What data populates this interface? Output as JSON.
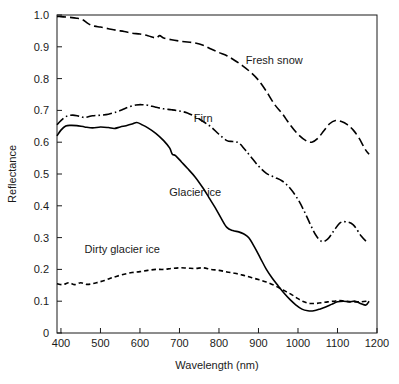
{
  "chart_data": {
    "type": "line",
    "title": "",
    "xlabel": "Wavelength (nm)",
    "ylabel": "Reflectance",
    "xlim": [
      390,
      1200
    ],
    "ylim": [
      0,
      1.0
    ],
    "grid": false,
    "legend_position": "inline-annotations",
    "xticks": [
      400,
      500,
      600,
      700,
      800,
      900,
      1000,
      1100,
      1200
    ],
    "xtick_labels": [
      "400",
      "500",
      "600",
      "700",
      "800",
      "900",
      "1000",
      "1100",
      "1200"
    ],
    "yticks": [
      0,
      0.1,
      0.2,
      0.3,
      0.4,
      0.5,
      0.6,
      0.7,
      0.8,
      0.9,
      1.0
    ],
    "ytick_labels": [
      "0",
      "0.1",
      "0.2",
      "0.3",
      "0.4",
      "0.5",
      "0.6",
      "0.7",
      "0.8",
      "0.9",
      "1.0"
    ],
    "series": [
      {
        "name": "Fresh snow",
        "line_style": "dashed",
        "color": "#000000",
        "label_x": 940,
        "label_y": 0.845,
        "x": [
          390,
          400,
          420,
          440,
          455,
          470,
          485,
          500,
          520,
          540,
          560,
          580,
          600,
          620,
          640,
          650,
          660,
          680,
          700,
          720,
          740,
          760,
          780,
          800,
          820,
          840,
          860,
          880,
          900,
          920,
          940,
          960,
          980,
          1000,
          1020,
          1035,
          1050,
          1065,
          1080,
          1095,
          1110,
          1125,
          1140,
          1155,
          1170,
          1180
        ],
        "y": [
          0.995,
          0.995,
          0.993,
          0.99,
          0.985,
          0.972,
          0.965,
          0.962,
          0.957,
          0.952,
          0.948,
          0.943,
          0.94,
          0.935,
          0.928,
          0.935,
          0.928,
          0.922,
          0.918,
          0.915,
          0.912,
          0.905,
          0.893,
          0.882,
          0.872,
          0.857,
          0.84,
          0.82,
          0.795,
          0.76,
          0.72,
          0.69,
          0.655,
          0.625,
          0.605,
          0.6,
          0.612,
          0.635,
          0.658,
          0.668,
          0.665,
          0.655,
          0.638,
          0.612,
          0.578,
          0.562
        ]
      },
      {
        "name": "Firn",
        "line_style": "dashdot",
        "color": "#000000",
        "label_x": 760,
        "label_y": 0.665,
        "x": [
          390,
          400,
          415,
          430,
          445,
          460,
          480,
          500,
          520,
          540,
          555,
          570,
          590,
          605,
          620,
          640,
          660,
          680,
          700,
          720,
          740,
          760,
          780,
          800,
          820,
          835,
          850,
          865,
          880,
          900,
          920,
          940,
          960,
          980,
          1000,
          1015,
          1030,
          1045,
          1060,
          1075,
          1090,
          1105,
          1120,
          1140,
          1160,
          1175
        ],
        "y": [
          0.655,
          0.668,
          0.682,
          0.685,
          0.682,
          0.678,
          0.683,
          0.685,
          0.688,
          0.695,
          0.702,
          0.71,
          0.717,
          0.718,
          0.716,
          0.71,
          0.705,
          0.702,
          0.698,
          0.692,
          0.68,
          0.665,
          0.648,
          0.625,
          0.605,
          0.602,
          0.598,
          0.578,
          0.555,
          0.525,
          0.502,
          0.49,
          0.478,
          0.455,
          0.42,
          0.385,
          0.345,
          0.308,
          0.288,
          0.295,
          0.32,
          0.345,
          0.35,
          0.34,
          0.305,
          0.285
        ]
      },
      {
        "name": "Glacier ice",
        "line_style": "solid",
        "color": "#000000",
        "label_x": 740,
        "label_y": 0.43,
        "x": [
          390,
          400,
          412,
          425,
          440,
          460,
          480,
          500,
          520,
          535,
          550,
          565,
          580,
          592,
          605,
          620,
          640,
          660,
          675,
          682,
          690,
          705,
          720,
          740,
          760,
          775,
          790,
          805,
          820,
          835,
          850,
          862,
          875,
          890,
          905,
          920,
          935,
          950,
          965,
          980,
          995,
          1010,
          1025,
          1040,
          1055,
          1070,
          1085,
          1100,
          1115,
          1130,
          1145,
          1160,
          1172,
          1180
        ],
        "y": [
          0.62,
          0.638,
          0.651,
          0.653,
          0.652,
          0.648,
          0.645,
          0.648,
          0.646,
          0.643,
          0.648,
          0.652,
          0.657,
          0.662,
          0.655,
          0.645,
          0.628,
          0.605,
          0.582,
          0.562,
          0.558,
          0.538,
          0.518,
          0.49,
          0.455,
          0.425,
          0.395,
          0.362,
          0.332,
          0.322,
          0.318,
          0.312,
          0.3,
          0.27,
          0.235,
          0.2,
          0.172,
          0.148,
          0.125,
          0.105,
          0.088,
          0.075,
          0.07,
          0.07,
          0.075,
          0.082,
          0.09,
          0.098,
          0.1,
          0.098,
          0.1,
          0.092,
          0.088,
          0.1
        ]
      },
      {
        "name": "Dirty glacier ice",
        "line_style": "shortdash",
        "color": "#000000",
        "label_x": 555,
        "label_y": 0.253,
        "x": [
          390,
          405,
          420,
          435,
          450,
          465,
          480,
          495,
          510,
          525,
          540,
          560,
          580,
          600,
          620,
          640,
          660,
          680,
          700,
          720,
          740,
          760,
          780,
          800,
          820,
          840,
          860,
          880,
          900,
          920,
          940,
          955,
          970,
          985,
          1000,
          1015,
          1030,
          1045,
          1060,
          1075,
          1090,
          1105,
          1120,
          1140,
          1160,
          1175
        ],
        "y": [
          0.155,
          0.152,
          0.158,
          0.152,
          0.158,
          0.153,
          0.155,
          0.16,
          0.165,
          0.172,
          0.178,
          0.185,
          0.19,
          0.193,
          0.197,
          0.2,
          0.2,
          0.203,
          0.205,
          0.204,
          0.203,
          0.205,
          0.2,
          0.197,
          0.192,
          0.188,
          0.182,
          0.175,
          0.168,
          0.16,
          0.15,
          0.14,
          0.13,
          0.12,
          0.108,
          0.098,
          0.093,
          0.093,
          0.095,
          0.098,
          0.1,
          0.102,
          0.1,
          0.098,
          0.098,
          0.1
        ]
      }
    ]
  }
}
